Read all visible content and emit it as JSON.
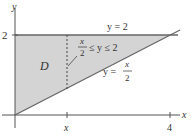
{
  "diagram": {
    "axes": {
      "x_label": "x",
      "y_label": "y",
      "x_ticks": [
        {
          "value": "x",
          "label": "x"
        },
        {
          "value": 4,
          "label": "4"
        }
      ],
      "y_ticks": [
        {
          "value": 2,
          "label": "2"
        }
      ]
    },
    "region": {
      "name": "D",
      "fill": "#d4d4d4",
      "vertices": [
        [
          0,
          0
        ],
        [
          0,
          2
        ],
        [
          4,
          2
        ]
      ]
    },
    "curves": [
      {
        "label": "y = 2",
        "equation": "y = 2"
      },
      {
        "label": "y = x/2",
        "equation": "y = x/2",
        "lhs": "y =",
        "num": "x",
        "den": "2"
      }
    ],
    "cross_section": {
      "label_num": "x",
      "label_den": "2",
      "label_rest": "≤ y ≤ 2"
    }
  }
}
